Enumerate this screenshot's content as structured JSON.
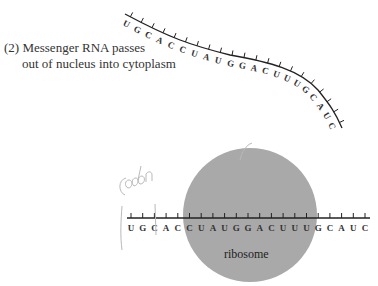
{
  "caption": {
    "line1": "(2) Messenger RNA passes",
    "line2": "out of nucleus into cytoplasm"
  },
  "mrna_curved": {
    "bases": [
      "U",
      "G",
      "C",
      "A",
      "C",
      "C",
      "U",
      "A",
      "U",
      "G",
      "G",
      "A",
      "C",
      "U",
      "U",
      "U",
      "G",
      "C",
      "A",
      "U",
      "C"
    ]
  },
  "mrna_straight": {
    "bases": [
      "U",
      "G",
      "C",
      "A",
      "C",
      "C",
      "U",
      "A",
      "U",
      "G",
      "G",
      "A",
      "C",
      "U",
      "U",
      "U",
      "G",
      "C",
      "A",
      "U",
      "C"
    ]
  },
  "ribosome": {
    "label": "ribosome",
    "color": "#a9a9a9"
  },
  "annotation": {
    "handwritten": "codon"
  }
}
